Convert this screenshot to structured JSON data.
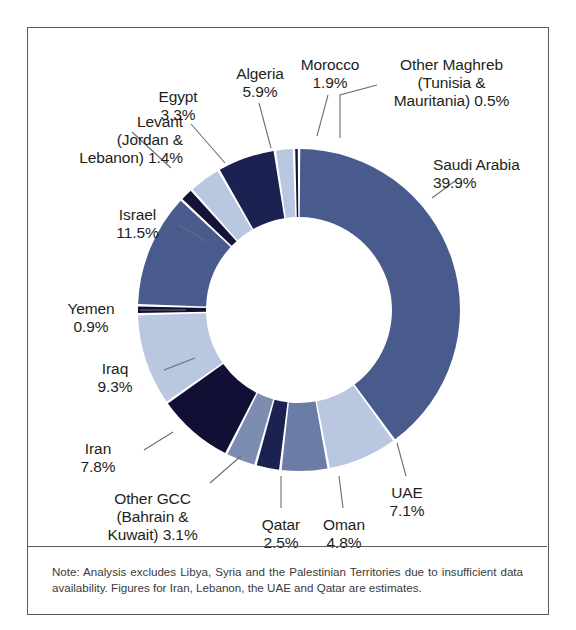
{
  "chart_data": {
    "type": "pie",
    "variant": "donut",
    "title": "",
    "subtitle": "",
    "xlabel": "",
    "ylabel": "",
    "legend_position": "none",
    "grid": false,
    "units": "%",
    "total": 100.0,
    "start_angle_deg": 0,
    "direction": "clockwise",
    "categories": [
      "Saudi Arabia",
      "UAE",
      "Oman",
      "Qatar",
      "Other GCC (Bahrain & Kuwait)",
      "Iran",
      "Iraq",
      "Yemen",
      "Israel",
      "Levant (Jordan & Lebanon)",
      "Egypt",
      "Algeria",
      "Morocco",
      "Other Maghreb (Tunisia & Mauritania)"
    ],
    "values": [
      39.9,
      7.1,
      4.8,
      2.5,
      3.1,
      7.8,
      9.3,
      0.9,
      11.5,
      1.4,
      3.3,
      5.9,
      1.9,
      0.5
    ],
    "colors": [
      "#485b8c",
      "#b9c7e0",
      "#6b7ca6",
      "#1b2150",
      "#7d8db2",
      "#120f35",
      "#b9c7e0",
      "#120f35",
      "#485b8c",
      "#141338",
      "#b9c7e0",
      "#1b2150",
      "#b9c7e0",
      "#141338"
    ],
    "slices": [
      {
        "name": "Saudi Arabia",
        "value": 39.9,
        "label": "Saudi Arabia",
        "value_text": "39.9%",
        "color": "#485b8c"
      },
      {
        "name": "UAE",
        "value": 7.1,
        "label": "UAE",
        "value_text": "7.1%",
        "color": "#b9c7e0"
      },
      {
        "name": "Oman",
        "value": 4.8,
        "label": "Oman",
        "value_text": "4.8%",
        "color": "#6b7ca6"
      },
      {
        "name": "Qatar",
        "value": 2.5,
        "label": "Qatar",
        "value_text": "2.5%",
        "color": "#1b2150"
      },
      {
        "name": "Other GCC",
        "value": 3.1,
        "label": "Other GCC (Bahrain & Kuwait)",
        "value_text": "3.1%",
        "color": "#7d8db2"
      },
      {
        "name": "Iran",
        "value": 7.8,
        "label": "Iran",
        "value_text": "7.8%",
        "color": "#120f35"
      },
      {
        "name": "Iraq",
        "value": 9.3,
        "label": "Iraq",
        "value_text": "9.3%",
        "color": "#b9c7e0"
      },
      {
        "name": "Yemen",
        "value": 0.9,
        "label": "Yemen",
        "value_text": "0.9%",
        "color": "#120f35"
      },
      {
        "name": "Israel",
        "value": 11.5,
        "label": "Israel",
        "value_text": "11.5%",
        "color": "#485b8c"
      },
      {
        "name": "Levant",
        "value": 1.4,
        "label": "Levant (Jordan & Lebanon)",
        "value_text": "1.4%",
        "color": "#141338"
      },
      {
        "name": "Egypt",
        "value": 3.3,
        "label": "Egypt",
        "value_text": "3.3%",
        "color": "#b9c7e0"
      },
      {
        "name": "Algeria",
        "value": 5.9,
        "label": "Algeria",
        "value_text": "5.9%",
        "color": "#1b2150"
      },
      {
        "name": "Morocco",
        "value": 1.9,
        "label": "Morocco",
        "value_text": "1.9%",
        "color": "#b9c7e0"
      },
      {
        "name": "Other Maghreb",
        "value": 0.5,
        "label": "Other Maghreb (Tunisia & Mauritania)",
        "value_text": "0.5%",
        "color": "#141338"
      }
    ]
  },
  "labels": {
    "saudi_arabia": "Saudi Arabia\n39.9%",
    "uae": "UAE\n7.1%",
    "oman": "Oman\n4.8%",
    "qatar": "Qatar\n2.5%",
    "other_gcc": "Other GCC\n(Bahrain &\nKuwait) 3.1%",
    "iran": "Iran\n7.8%",
    "iraq": "Iraq\n9.3%",
    "yemen": "Yemen\n0.9%",
    "israel": "Israel\n11.5%",
    "levant": "Levant\n(Jordan &\nLebanon) 1.4%",
    "egypt": "Egypt\n3.3%",
    "algeria": "Algeria\n5.9%",
    "morocco": "Morocco\n1.9%",
    "other_maghreb": "Other Maghreb\n(Tunisia &\nMauritania) 0.5%"
  },
  "note": {
    "text": "Note: Analysis excludes Libya, Syria and the Palestinian Territories due to insufficient data availability. Figures for Iran, Lebanon, the UAE and Qatar are estimates."
  },
  "style": {
    "frame_color": "#58595b",
    "text_color": "#231f20",
    "leader_color": "#6d6e71",
    "background": "#ffffff"
  }
}
